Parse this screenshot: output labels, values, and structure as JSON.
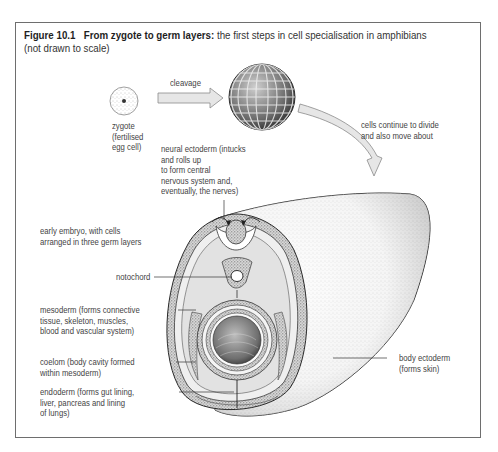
{
  "figure": {
    "number": "Figure 10.1",
    "title": "From zygote to germ layers:",
    "subtitle": "the first steps in cell specialisation in amphibians",
    "note": "(not drawn to scale)"
  },
  "stages": {
    "zygote": {
      "lines": [
        "zygote",
        "(fertilised",
        "egg cell)"
      ]
    },
    "cleavage_arrow": {
      "label": "cleavage"
    },
    "blastula_arrow": {
      "lines": [
        "cells continue to divide",
        "and also move about"
      ]
    }
  },
  "annotations": {
    "neural_ectoderm": {
      "lines": [
        "neural ectoderm (intucks",
        "and rolls up",
        "to form central",
        "nervous system and,",
        "eventually, the nerves)"
      ]
    },
    "early_embryo": {
      "lines": [
        "early embryo, with cells",
        "arranged in three germ layers"
      ]
    },
    "notochord": {
      "lines": [
        "notochord"
      ]
    },
    "mesoderm": {
      "lines": [
        "mesoderm (forms connective",
        "tissue, skeleton, muscles,",
        "blood and vascular system)"
      ]
    },
    "coelom": {
      "lines": [
        "coelom (body cavity formed",
        "within mesoderm)"
      ]
    },
    "endoderm": {
      "lines": [
        "endoderm (forms gut lining,",
        "liver, pancreas and lining",
        "of lungs)"
      ]
    },
    "body_ectoderm": {
      "lines": [
        "body ectoderm",
        "(forms skin)"
      ]
    }
  },
  "colors": {
    "frame": "#6e6e6e",
    "text": "#444444",
    "line_art": "#2a2a2a",
    "arrow_fill": "#e4e4e4",
    "coelom_fill": "#e2e2e2",
    "stipple": "#9a9a9a"
  }
}
